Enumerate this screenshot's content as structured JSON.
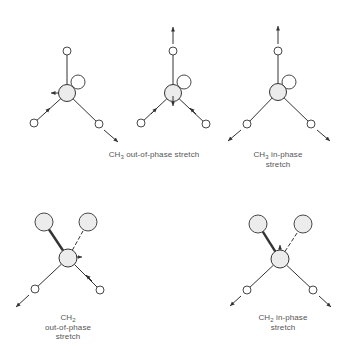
{
  "figure": {
    "colors": {
      "line": "#333333",
      "atom_fill": "#ececec",
      "text": "#555555",
      "background": "#ffffff"
    },
    "panels": [
      {
        "id": "ch3-oop-a",
        "group": "CH3 out-of-phase stretch",
        "central_atom": {
          "x": 67,
          "y": 93,
          "r": 8.5,
          "label": "C"
        },
        "back_atom": {
          "x": 78,
          "y": 82,
          "r": 7
        },
        "hydrogens": [
          {
            "x": 67,
            "y": 51,
            "r": 4
          },
          {
            "x": 34,
            "y": 123,
            "r": 4
          },
          {
            "x": 99,
            "y": 124,
            "r": 4
          }
        ],
        "displacement_arrows": [
          {
            "from": [
              59,
              93
            ],
            "to": [
              51,
              93
            ]
          },
          {
            "from": [
              104,
              130
            ],
            "to": [
              118,
              142
            ]
          },
          {
            "from": [
              44,
              114
            ],
            "to": [
              50,
              108
            ]
          }
        ]
      },
      {
        "id": "ch3-oop-b",
        "group": "CH3 out-of-phase stretch",
        "central_atom": {
          "x": 173,
          "y": 93,
          "r": 8.5,
          "label": "C"
        },
        "back_atom": {
          "x": 184,
          "y": 82,
          "r": 7
        },
        "hydrogens": [
          {
            "x": 173,
            "y": 51,
            "r": 4
          },
          {
            "x": 141,
            "y": 123,
            "r": 4
          },
          {
            "x": 206,
            "y": 124,
            "r": 4
          }
        ],
        "displacement_arrows": [
          {
            "from": [
              173,
              44
            ],
            "to": [
              173,
              27
            ]
          },
          {
            "from": [
              173,
              96
            ],
            "to": [
              173,
              106
            ]
          },
          {
            "from": [
              151,
              114
            ],
            "to": [
              157,
              108
            ]
          },
          {
            "from": [
              196,
              114
            ],
            "to": [
              190,
              108
            ]
          }
        ]
      },
      {
        "id": "ch3-ip",
        "group": "CH3 in-phase stretch",
        "central_atom": {
          "x": 278,
          "y": 92,
          "r": 8.5,
          "label": "C"
        },
        "back_atom": {
          "x": 289,
          "y": 82,
          "r": 7
        },
        "hydrogens": [
          {
            "x": 278,
            "y": 51,
            "r": 4
          },
          {
            "x": 247,
            "y": 124,
            "r": 4
          },
          {
            "x": 311,
            "y": 124,
            "r": 4
          }
        ],
        "displacement_arrows": [
          {
            "from": [
              278,
              44
            ],
            "to": [
              278,
              26
            ]
          },
          {
            "from": [
              241,
              130
            ],
            "to": [
              228,
              141
            ]
          },
          {
            "from": [
              317,
              130
            ],
            "to": [
              330,
              141
            ]
          }
        ]
      },
      {
        "id": "ch2-oop",
        "group": "CH2 out-of-phase stretch",
        "central_atom": {
          "x": 68,
          "y": 258,
          "r": 9,
          "label": "C"
        },
        "heavy_atoms": [
          {
            "x": 44,
            "y": 222,
            "r": 9,
            "bond": "bold"
          },
          {
            "x": 88,
            "y": 222,
            "r": 9,
            "bond": "dashed"
          }
        ],
        "hydrogens": [
          {
            "x": 35,
            "y": 289,
            "r": 4
          },
          {
            "x": 100,
            "y": 290,
            "r": 4
          }
        ],
        "displacement_arrows": [
          {
            "from": [
              29,
              295
            ],
            "to": [
              16,
              307
            ]
          },
          {
            "from": [
              92,
              281
            ],
            "to": [
              86,
              275
            ]
          },
          {
            "from": [
              76,
              257
            ],
            "to": [
              82,
              257
            ]
          }
        ]
      },
      {
        "id": "ch2-ip",
        "group": "CH2 in-phase stretch",
        "central_atom": {
          "x": 280,
          "y": 259,
          "r": 9,
          "label": "C"
        },
        "heavy_atoms": [
          {
            "x": 258,
            "y": 224,
            "r": 9,
            "bond": "bold"
          },
          {
            "x": 303,
            "y": 224,
            "r": 9,
            "bond": "dashed"
          }
        ],
        "hydrogens": [
          {
            "x": 247,
            "y": 290,
            "r": 4
          },
          {
            "x": 313,
            "y": 290,
            "r": 4
          }
        ],
        "displacement_arrows": [
          {
            "from": [
              241,
              296
            ],
            "to": [
              230,
              306
            ]
          },
          {
            "from": [
              319,
              296
            ],
            "to": [
              331,
              307
            ]
          },
          {
            "from": [
              280,
              250
            ],
            "to": [
              280,
              245
            ]
          }
        ]
      }
    ],
    "labels": {
      "ch3_oop": {
        "pre": "CH",
        "sub": "3",
        "post": " out-of-phase stretch"
      },
      "ch3_ip": {
        "line1_pre": "CH",
        "line1_sub": "3",
        "line1_post": " in-phase",
        "line2": "stretch"
      },
      "ch2_oop": {
        "line1_pre": "CH",
        "line1_sub": "2",
        "line2": "out-of-phase",
        "line3": "stretch"
      },
      "ch2_ip": {
        "line1_pre": "CH",
        "line1_sub": "2",
        "line1_post": " in-phase",
        "line2": "stretch"
      }
    }
  }
}
